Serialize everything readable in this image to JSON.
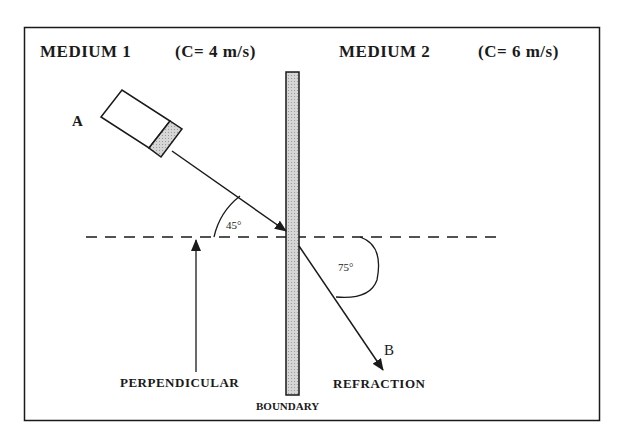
{
  "medium1": {
    "title": "MEDIUM  1",
    "speed": "(C= 4 m/s)"
  },
  "medium2": {
    "title": "MEDIUM  2",
    "speed": "(C= 6 m/s)"
  },
  "points": {
    "source": "A",
    "end": "B"
  },
  "angles": {
    "incident": "45°",
    "refracted": "75°"
  },
  "labels": {
    "perpendicular": "PERPENDICULAR",
    "refraction": "REFRACTION",
    "boundary": "BOUNDARY"
  },
  "colors": {
    "line": "#1a1a1a",
    "boundary_fill": "#c8c8c8",
    "source_tip_fill": "#c8c8c8"
  }
}
